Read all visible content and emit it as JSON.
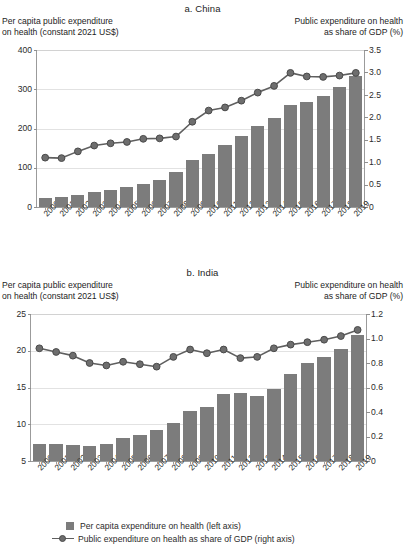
{
  "figure": {
    "legend": {
      "bar_label": "Per capita expenditure on health (left axis)",
      "line_label": "Public expenditure on health as share of GDP (right axis)",
      "bar_color": "#7c7c7c",
      "line_color": "#5f5f5f",
      "marker_color": "#6e6e6e"
    }
  },
  "chart_data": [
    {
      "type": "bar",
      "id": "panel-a-china",
      "title": "a. China",
      "left_axis_label": "Per capita public expenditure\non health (constant 2021 US$)",
      "right_axis_label": "Public expenditure on health\nas share of GDP (%)",
      "xlabel": "",
      "grid": true,
      "legend_position": "bottom",
      "categories": [
        "2000",
        "2001",
        "2002",
        "2003",
        "2004",
        "2005",
        "2006",
        "2007",
        "2008",
        "2009",
        "2010",
        "2011",
        "2012",
        "2013",
        "2014",
        "2015",
        "2016",
        "2017",
        "2018",
        "2019"
      ],
      "ylim": [
        0,
        400
      ],
      "yticks": [
        0,
        100,
        200,
        300,
        400
      ],
      "ylim_right": [
        0,
        3.5
      ],
      "yticks_right": [
        "0",
        "0.5",
        "1.0",
        "1.5",
        "2.0",
        "2.5",
        "3.0",
        "3.5"
      ],
      "series": [
        {
          "name": "Per capita expenditure on health (left axis)",
          "axis": "left",
          "kind": "bar",
          "values": [
            24,
            26,
            31,
            38,
            43,
            51,
            59,
            68,
            90,
            121,
            135,
            157,
            181,
            207,
            227,
            259,
            268,
            283,
            306,
            333
          ]
        },
        {
          "name": "Public expenditure on health as share of GDP (right axis)",
          "axis": "right",
          "kind": "line",
          "values": [
            1.1,
            1.09,
            1.24,
            1.37,
            1.42,
            1.45,
            1.52,
            1.53,
            1.57,
            1.9,
            2.15,
            2.22,
            2.37,
            2.55,
            2.7,
            2.99,
            2.91,
            2.9,
            2.93,
            2.99
          ]
        }
      ]
    },
    {
      "type": "bar",
      "id": "panel-b-india",
      "title": "b. India",
      "left_axis_label": "Per capita public expenditure\non health (constant 2021 US$)",
      "right_axis_label": "Public expenditure on health\nas share of GDP (%)",
      "xlabel": "",
      "grid": true,
      "legend_position": "bottom",
      "categories": [
        "2000",
        "2001",
        "2002",
        "2003",
        "2004",
        "2005",
        "2006",
        "2007",
        "2008",
        "2009",
        "2010",
        "2011",
        "2012",
        "2013",
        "2014",
        "2015",
        "2016",
        "2017",
        "2018",
        "2019"
      ],
      "ylim": [
        5,
        25
      ],
      "yticks": [
        5,
        10,
        15,
        20,
        25
      ],
      "ylim_right": [
        0,
        1.2
      ],
      "yticks_right": [
        "0",
        "0.2",
        "0.4",
        "0.6",
        "0.8",
        "1.0",
        "1.2"
      ],
      "series": [
        {
          "name": "Per capita expenditure on health (left axis)",
          "axis": "left",
          "kind": "bar",
          "values": [
            7.3,
            7.3,
            7.2,
            7.1,
            7.3,
            8.1,
            8.6,
            9.2,
            10.2,
            11.8,
            12.3,
            14.1,
            14.2,
            13.9,
            14.8,
            16.9,
            18.4,
            19.2,
            20.2,
            22.2
          ]
        },
        {
          "name": "Public expenditure on health as share of GDP (right axis)",
          "axis": "right",
          "kind": "line",
          "values": [
            0.92,
            0.89,
            0.86,
            0.8,
            0.78,
            0.81,
            0.79,
            0.77,
            0.85,
            0.91,
            0.88,
            0.91,
            0.84,
            0.85,
            0.92,
            0.95,
            0.97,
            0.99,
            1.02,
            1.07
          ]
        }
      ]
    }
  ]
}
